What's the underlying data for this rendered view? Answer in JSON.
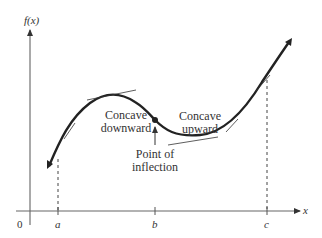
{
  "axes": {
    "y_label": "f(x)",
    "x_label": "x",
    "origin_label": "0",
    "ticks": [
      "a",
      "b",
      "c"
    ]
  },
  "annotations": {
    "concave_down": [
      "Concave",
      "downward"
    ],
    "concave_up": [
      "Concave",
      "upward"
    ],
    "inflection": [
      "Point of",
      "inflection"
    ]
  },
  "colors": {
    "curve": "#222222",
    "axis": "#555555",
    "text": "#333333"
  }
}
